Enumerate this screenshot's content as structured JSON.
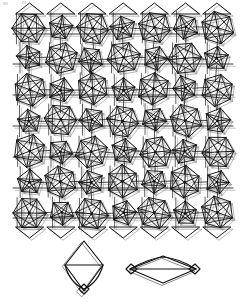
{
  "figure": {
    "kind": "aperiodic-tiling-diagram",
    "title": "",
    "caption": "",
    "canvas": {
      "width": 245,
      "height": 308,
      "background": "#ffffff"
    },
    "colors": {
      "ink_dark": "#111111",
      "ink_mid": "#2b2b2b",
      "ink_light": "#9a9a9a",
      "ink_faint": "#bdbdbd",
      "background": "#ffffff"
    },
    "main_panel": {
      "name": "tiling-patch",
      "bounds": {
        "x": 14,
        "y": 12,
        "width": 218,
        "height": 217
      },
      "description": "Dense patch of a decorated rhombus tiling: overlapping circular/pentagonal star motifs drawn with triangulated chords, plus long horizontal band lines; a second copy of the network is drawn slightly offset in light gray.",
      "motif_columns": 7,
      "motif_rows": 7,
      "cell_width": 31.2,
      "cell_height": 30.9,
      "band_lines_y": [
        34,
        64,
        95,
        126,
        157,
        188,
        218
      ],
      "offset_overlay": {
        "dx": 2.2,
        "dy": 2.2,
        "color": "#9a9a9a"
      }
    },
    "prototiles": [
      {
        "name": "prototile-thin-rhomb",
        "label": "",
        "position": {
          "cx": 84,
          "cy": 266
        },
        "shape": "vertical rhombus (thin), drawn twice with a small offset; horizontal chord across the waist; small rhomb decoration at the lower vertex",
        "vertices": [
          {
            "x": 84,
            "y": 241
          },
          {
            "x": 103,
            "y": 265
          },
          {
            "x": 84,
            "y": 291
          },
          {
            "x": 65,
            "y": 265
          }
        ],
        "chord": [
          {
            "x": 65,
            "y": 265
          },
          {
            "x": 103,
            "y": 265
          }
        ]
      },
      {
        "name": "prototile-fat-rhomb",
        "label": "",
        "position": {
          "cx": 163,
          "cy": 270
        },
        "shape": "wide flat rhombus, drawn twice with a small offset; shallow arc-like chord across the long diagonal; small rhomb decorations at the left and right vertices",
        "vertices": [
          {
            "x": 163,
            "y": 256
          },
          {
            "x": 196,
            "y": 269
          },
          {
            "x": 163,
            "y": 283
          },
          {
            "x": 130,
            "y": 269
          }
        ],
        "chord": [
          {
            "x": 130,
            "y": 269
          },
          {
            "x": 196,
            "y": 269
          }
        ]
      }
    ],
    "artifacts": {
      "top_left_specks": [
        {
          "x": 3,
          "y": 2,
          "w": 5,
          "h": 3
        },
        {
          "x": 22,
          "y": 1,
          "w": 4,
          "h": 3
        }
      ]
    }
  }
}
